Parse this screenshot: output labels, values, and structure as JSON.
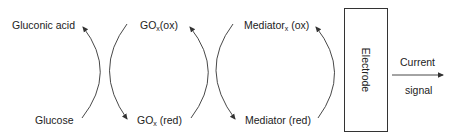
{
  "diagram": {
    "type": "biosensor-reaction-scheme",
    "stroke_color": "#333333",
    "labels": {
      "gluconic_acid": "Gluconic acid",
      "glucose": "Glucose",
      "gox_ox_main": "GO",
      "gox_ox_sub": "x",
      "gox_ox_suffix": "(ox)",
      "gox_red_main": "GO",
      "gox_red_sub": "x",
      "gox_red_suffix": " (red)",
      "mediator_ox_main": "Mediator",
      "mediator_ox_sub": "x",
      "mediator_ox_suffix": " (ox)",
      "mediator_red": "Mediator (red)",
      "electrode": "Electrode",
      "current": "Current",
      "signal": "signal"
    },
    "arrows": [
      {
        "from": "Glucose",
        "to": "Gluconic acid"
      },
      {
        "from": "GOx(ox)",
        "to": "GOx (red)"
      },
      {
        "from": "GOx (red)",
        "to": "GOx(ox)"
      },
      {
        "from": "Mediatorx (ox)",
        "to": "Mediator (red)"
      },
      {
        "from": "Mediator (red)",
        "to": "Mediatorx (ox)"
      },
      {
        "from": "Electrode",
        "to": "Current signal"
      }
    ]
  }
}
